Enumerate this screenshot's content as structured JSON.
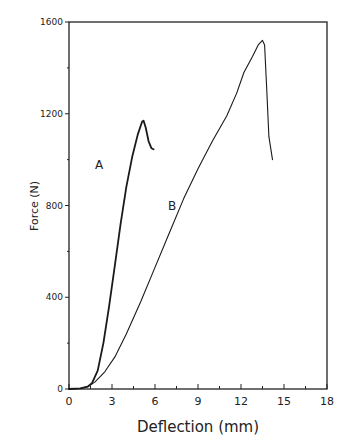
{
  "chart_data": {
    "type": "line",
    "title": "",
    "xlabel": "Deflection (mm)",
    "ylabel": "Force (N)",
    "xlim": [
      0,
      18
    ],
    "ylim": [
      0,
      1600
    ],
    "xticks": [
      0,
      3,
      6,
      9,
      12,
      15,
      18
    ],
    "yticks": [
      0,
      400,
      800,
      1200,
      1600
    ],
    "x_minor_step": 1.5,
    "y_minor_step": 200,
    "grid": false,
    "legend": "none (inline curve labels)",
    "annotations": [
      {
        "text": "A",
        "x": 2.1,
        "y": 960
      },
      {
        "text": "B",
        "x": 7.2,
        "y": 780
      }
    ],
    "series": [
      {
        "name": "A",
        "line_width": 1.8,
        "points": [
          [
            0,
            0
          ],
          [
            0.8,
            3
          ],
          [
            1.3,
            10
          ],
          [
            1.6,
            25
          ],
          [
            2.0,
            80
          ],
          [
            2.4,
            200
          ],
          [
            2.8,
            360
          ],
          [
            3.2,
            540
          ],
          [
            3.6,
            720
          ],
          [
            4.0,
            880
          ],
          [
            4.4,
            1010
          ],
          [
            4.8,
            1110
          ],
          [
            5.1,
            1165
          ],
          [
            5.2,
            1170
          ],
          [
            5.35,
            1140
          ],
          [
            5.55,
            1080
          ],
          [
            5.75,
            1050
          ],
          [
            5.9,
            1045
          ]
        ]
      },
      {
        "name": "B",
        "line_width": 1.1,
        "points": [
          [
            0,
            0
          ],
          [
            0.8,
            3
          ],
          [
            1.3,
            10
          ],
          [
            1.8,
            30
          ],
          [
            2.5,
            75
          ],
          [
            3.2,
            140
          ],
          [
            4.0,
            240
          ],
          [
            5.0,
            380
          ],
          [
            6.0,
            530
          ],
          [
            7.0,
            680
          ],
          [
            8.0,
            830
          ],
          [
            9.0,
            960
          ],
          [
            10.0,
            1080
          ],
          [
            11.0,
            1190
          ],
          [
            11.7,
            1290
          ],
          [
            12.2,
            1380
          ],
          [
            12.8,
            1450
          ],
          [
            13.2,
            1500
          ],
          [
            13.5,
            1520
          ],
          [
            13.65,
            1500
          ],
          [
            13.8,
            1300
          ],
          [
            13.95,
            1100
          ],
          [
            14.2,
            1000
          ]
        ]
      }
    ]
  }
}
